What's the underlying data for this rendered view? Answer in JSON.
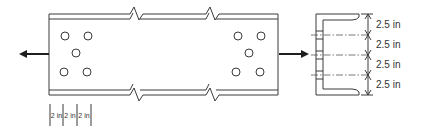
{
  "diagram": {
    "type": "bolted channel connection",
    "members": {
      "plan_view": "channel member with break lines, shown in plan with two bolt groups",
      "section_view": "channel cross-section"
    },
    "bolt_groups": [
      {
        "side": "left",
        "bolt_count": 5,
        "pattern": "2-1-2"
      },
      {
        "side": "right",
        "bolt_count": 5,
        "pattern": "2-1-2"
      }
    ],
    "load_arrows": [
      {
        "side": "left",
        "direction": "left"
      },
      {
        "side": "right",
        "direction": "right"
      }
    ],
    "longitudinal_spacing": {
      "labels": [
        "2 in",
        "2 in",
        "2 in"
      ]
    },
    "transverse_spacing": {
      "labels": [
        "2.5 in",
        "2.5 in",
        "2.5 in",
        "2.5 in"
      ]
    },
    "colors": {
      "line": "#3a3a3a",
      "arrow": "#1e1e1e",
      "background": "#ffffff"
    }
  }
}
